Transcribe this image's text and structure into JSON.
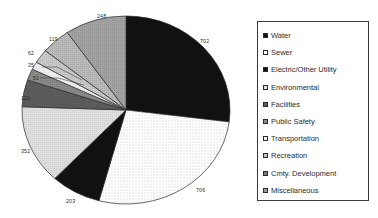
{
  "chart_data": {
    "type": "pie",
    "title": "",
    "labels_shown": true,
    "legend_position": "right",
    "categories": [
      "Water",
      "Sewer",
      "Electric/Other Utility",
      "Environmental",
      "Facilities",
      "Public Safety",
      "Transportation",
      "Recreation",
      "Cmty. Development",
      "Miscellaneous"
    ],
    "values": [
      702,
      706,
      203,
      352,
      120,
      51,
      35,
      62,
      119,
      248
    ],
    "value_labels": [
      "702",
      "706",
      "203",
      "352",
      "120",
      "51",
      "35",
      "62",
      "119",
      "248"
    ],
    "slice_fills": [
      "solid-black",
      "dotted-white",
      "solid-black",
      "light-gray",
      "dark-gray",
      "mid-gray-dark",
      "very-light-gray",
      "mid-light-gray",
      "light-gray-hatch",
      "mid-gray"
    ],
    "start_angle_deg": 0,
    "direction": "clockwise"
  },
  "legend": {
    "items": [
      {
        "label": "Water",
        "swatch": "swatch-black"
      },
      {
        "label": "Sewer",
        "swatch": "swatch-white"
      },
      {
        "label": "Electric/Other Utility",
        "swatch": "swatch-black"
      },
      {
        "label": "Environmental",
        "swatch": "swatch-light"
      },
      {
        "label": "Facilities",
        "swatch": "swatch-dark-gray"
      },
      {
        "label": "Public Safety",
        "swatch": "swatch-mid-gray"
      },
      {
        "label": "Transportation",
        "swatch": "swatch-very-light"
      },
      {
        "label": "Recreation",
        "swatch": "swatch-mid-light"
      },
      {
        "label": "Cmty. Development",
        "swatch": "swatch-dark-hatch"
      },
      {
        "label": "Miscellaneous",
        "swatch": "swatch-mid-hatch"
      }
    ]
  },
  "colors": {
    "black": "#111111",
    "white": "#ffffff",
    "light_gray": "#d9d9d9",
    "very_light_gray": "#eeeeee",
    "mid_light_gray": "#c4c4c4",
    "mid_gray": "#9a9a9a",
    "dark_gray": "#595959",
    "outline": "#2a2a2a",
    "text": "#2d2d2d"
  }
}
